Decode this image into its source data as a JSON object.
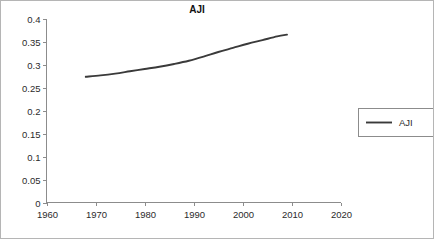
{
  "chart_data": {
    "type": "line",
    "title": "AJI",
    "xlabel": "",
    "ylabel": "",
    "xlim": [
      1960,
      2020
    ],
    "ylim": [
      0,
      0.4
    ],
    "grid": false,
    "legend_position": "right",
    "x_ticks": [
      1960,
      1970,
      1980,
      1990,
      2000,
      2010,
      2020
    ],
    "x_tick_labels": [
      "1960",
      "1970",
      "1980",
      "1990",
      "2000",
      "2010",
      "2020"
    ],
    "y_ticks": [
      0,
      0.05,
      0.1,
      0.15,
      0.2,
      0.25,
      0.3,
      0.35,
      0.4
    ],
    "y_tick_labels": [
      "0",
      "0.05",
      "0.1",
      "0.15",
      "0.2",
      "0.25",
      "0.3",
      "0.35",
      "0.4"
    ],
    "series": [
      {
        "name": "AJI",
        "color": "#3a3a3a",
        "x": [
          1968,
          1971,
          1974,
          1977,
          1980,
          1983,
          1986,
          1989,
          1992,
          1995,
          1998,
          2001,
          2004,
          2007,
          2009
        ],
        "values": [
          0.274,
          0.277,
          0.281,
          0.286,
          0.291,
          0.296,
          0.302,
          0.309,
          0.318,
          0.328,
          0.337,
          0.346,
          0.354,
          0.362,
          0.366
        ]
      }
    ]
  },
  "legend": {
    "entries": [
      {
        "label": "AJI",
        "color": "#3a3a3a"
      }
    ]
  },
  "colors": {
    "series": "#3a3a3a",
    "axis": "#8c8c8c",
    "text": "#2b2b2b",
    "border": "#b5b5b5",
    "background": "#ffffff"
  }
}
